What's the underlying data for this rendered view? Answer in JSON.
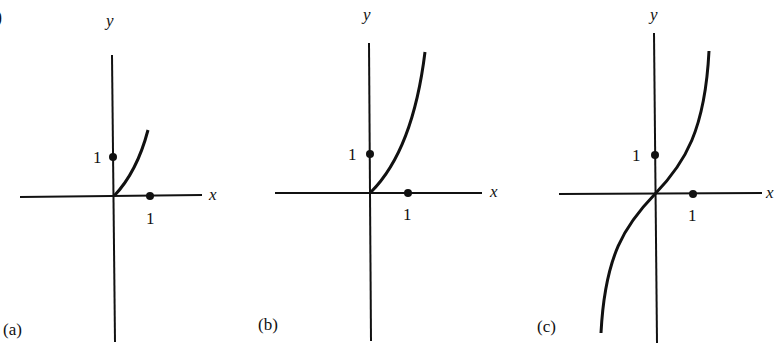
{
  "figure": {
    "corner_fragment": ")",
    "panels": [
      {
        "id": "a",
        "label": "(a)",
        "x_axis_label": "x",
        "y_axis_label": "y",
        "x_tick": "1",
        "y_tick": "1",
        "curve": "increasing, x >= 0 only, concave up, short"
      },
      {
        "id": "b",
        "label": "(b)",
        "x_axis_label": "x",
        "y_axis_label": "y",
        "x_tick": "1",
        "y_tick": "1",
        "curve": "increasing, x >= 0 only, concave up, tall"
      },
      {
        "id": "c",
        "label": "(c)",
        "x_axis_label": "x",
        "y_axis_label": "y",
        "x_tick": "1",
        "y_tick": "1",
        "curve": "increasing, odd function through origin"
      }
    ]
  },
  "colors": {
    "ink": "#111111",
    "background": "#ffffff"
  }
}
